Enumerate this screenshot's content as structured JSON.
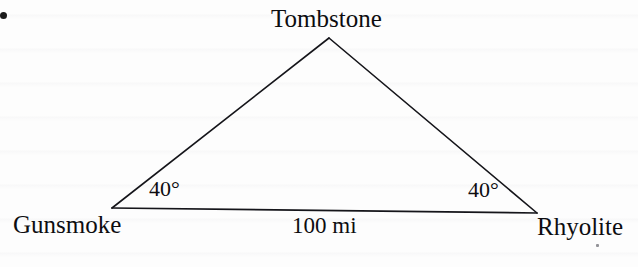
{
  "diagram": {
    "type": "triangle-geometry-diagram",
    "background_color": "#fdfdfd",
    "stroke_color": "#15151a",
    "vertices": {
      "apex": {
        "name": "Tombstone",
        "x": 329,
        "y": 38
      },
      "left": {
        "name": "Gunsmoke",
        "x": 112,
        "y": 208
      },
      "right": {
        "name": "Rhyolite",
        "x": 537,
        "y": 213
      }
    },
    "labels": {
      "apex_label": "Tombstone",
      "left_label": "Gunsmoke",
      "right_label": "Rhyolite",
      "base_length": "100 mi",
      "angle_left": "40°",
      "angle_right": "40°"
    },
    "measurements": {
      "base_distance_value": 100,
      "base_distance_unit": "mi",
      "angle_at_gunsmoke_degrees": 40,
      "angle_at_rhyolite_degrees": 40,
      "implied_apex_angle_degrees": 100
    },
    "marks": {
      "bullet_dot": "page-bullet-dot",
      "speck": "scan-speck"
    }
  }
}
